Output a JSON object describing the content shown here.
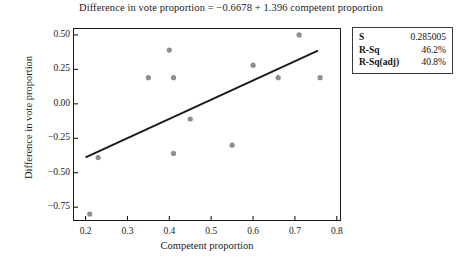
{
  "chart_data": {
    "type": "scatter",
    "title": "Difference in vote proportion =  −0.6678 + 1.396 competent proportion",
    "xlabel": "Competent proportion",
    "ylabel": "Difference in vote proportion",
    "xlim": [
      0.17,
      0.81
    ],
    "ylim": [
      -0.85,
      0.55
    ],
    "xticks": [
      "0.2",
      "0.3",
      "0.4",
      "0.5",
      "0.6",
      "0.7",
      "0.8"
    ],
    "xtick_values": [
      0.2,
      0.3,
      0.4,
      0.5,
      0.6,
      0.7,
      0.8
    ],
    "yticks": [
      "0.50",
      "0.25",
      "0.00",
      "−0.25",
      "−0.50",
      "−0.75"
    ],
    "ytick_values": [
      0.5,
      0.25,
      0.0,
      -0.25,
      -0.5,
      -0.75
    ],
    "grid": false,
    "legend": "none",
    "marker_color": "#8e8e8e",
    "line_color": "#1a1a1a",
    "points": [
      {
        "x": 0.21,
        "y": -0.8
      },
      {
        "x": 0.23,
        "y": -0.39
      },
      {
        "x": 0.35,
        "y": 0.19
      },
      {
        "x": 0.4,
        "y": 0.39
      },
      {
        "x": 0.41,
        "y": 0.19
      },
      {
        "x": 0.41,
        "y": -0.36
      },
      {
        "x": 0.45,
        "y": -0.11
      },
      {
        "x": 0.55,
        "y": -0.3
      },
      {
        "x": 0.6,
        "y": 0.28
      },
      {
        "x": 0.66,
        "y": 0.19
      },
      {
        "x": 0.71,
        "y": 0.5
      },
      {
        "x": 0.76,
        "y": 0.19
      }
    ],
    "fit_line": {
      "intercept": -0.6678,
      "slope": 1.396,
      "x_start": 0.2,
      "x_end": 0.755
    }
  },
  "stats_box": {
    "rows": [
      {
        "key": "S",
        "value": "0.285005"
      },
      {
        "key": "R-Sq",
        "value": "46.2%"
      },
      {
        "key": "R-Sq(adj)",
        "value": "40.8%"
      }
    ]
  }
}
